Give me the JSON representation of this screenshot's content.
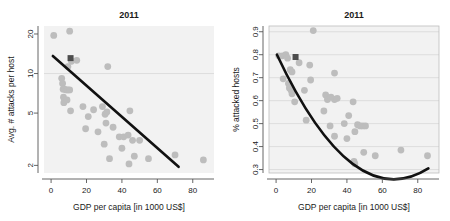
{
  "figure": {
    "width": 450,
    "height": 221,
    "background": "#ffffff",
    "point_color": "#bdbdbd",
    "highlight_color": "#4d4d4d",
    "trend_color": "#111111",
    "grid_color": "#d8d8d8",
    "panel_color": "#f2f2f2"
  },
  "chart_data": [
    {
      "type": "scatter",
      "id": "left",
      "title": "2011",
      "xlabel": "GDP per capita [in 1000 US$]",
      "ylabel": "Avg. # attacks per host",
      "xlim": [
        -4,
        92
      ],
      "ylim": [
        1.75,
        23
      ],
      "yscale": "log",
      "xscale": "linear",
      "xticks": [
        0,
        20,
        40,
        60,
        80
      ],
      "xticklabels": [
        "0",
        "20",
        "40",
        "60",
        "80"
      ],
      "yticks": [
        2,
        5,
        10,
        20
      ],
      "yticklabels": [
        "2",
        "5",
        "10",
        "20"
      ],
      "gridlines_y": [
        10
      ],
      "grid": "horizontal-sparse",
      "legend": "none",
      "points": [
        {
          "x": 1.5,
          "y": 19.5
        },
        {
          "x": 10.5,
          "y": 21.0
        },
        {
          "x": 9.5,
          "y": 11.3
        },
        {
          "x": 11.5,
          "y": 12.4
        },
        {
          "x": 14.5,
          "y": 12.6
        },
        {
          "x": 32.0,
          "y": 11.3
        },
        {
          "x": 6.0,
          "y": 9.2
        },
        {
          "x": 6.5,
          "y": 8.4
        },
        {
          "x": 6.8,
          "y": 7.6
        },
        {
          "x": 7.5,
          "y": 7.6
        },
        {
          "x": 8.5,
          "y": 7.5
        },
        {
          "x": 9.5,
          "y": 7.5
        },
        {
          "x": 10.5,
          "y": 7.5
        },
        {
          "x": 7.0,
          "y": 6.6
        },
        {
          "x": 7.2,
          "y": 6.0
        },
        {
          "x": 9.0,
          "y": 6.3
        },
        {
          "x": 11.0,
          "y": 5.2
        },
        {
          "x": 18.0,
          "y": 5.6
        },
        {
          "x": 21.0,
          "y": 4.7
        },
        {
          "x": 24.0,
          "y": 5.3
        },
        {
          "x": 29.0,
          "y": 5.6
        },
        {
          "x": 30.5,
          "y": 4.9
        },
        {
          "x": 31.5,
          "y": 5.1
        },
        {
          "x": 44.5,
          "y": 5.2
        },
        {
          "x": 19.5,
          "y": 3.8
        },
        {
          "x": 26.5,
          "y": 3.6
        },
        {
          "x": 31.0,
          "y": 4.2
        },
        {
          "x": 35.0,
          "y": 3.9
        },
        {
          "x": 38.5,
          "y": 3.3
        },
        {
          "x": 41.0,
          "y": 3.3
        },
        {
          "x": 43.5,
          "y": 3.4
        },
        {
          "x": 46.0,
          "y": 3.1
        },
        {
          "x": 50.0,
          "y": 3.1
        },
        {
          "x": 30.0,
          "y": 2.9
        },
        {
          "x": 40.0,
          "y": 2.7
        },
        {
          "x": 44.0,
          "y": 2.05
        },
        {
          "x": 33.0,
          "y": 2.25
        },
        {
          "x": 47.0,
          "y": 2.35
        },
        {
          "x": 55.0,
          "y": 2.25
        },
        {
          "x": 70.0,
          "y": 2.4
        },
        {
          "x": 86.0,
          "y": 2.2
        }
      ],
      "highlight_point": {
        "x": 11.0,
        "y": 13.1,
        "shape": "square"
      },
      "trend": {
        "type": "line",
        "x0": 1.0,
        "y0": 13.6,
        "x1": 72.0,
        "y1": 1.95
      }
    },
    {
      "type": "scatter",
      "id": "right",
      "title": "2011",
      "xlabel": "GDP per capita [in 1000 US$]",
      "ylabel": "% attacked hosts",
      "xlim": [
        -4,
        92
      ],
      "ylim": [
        0.285,
        0.925
      ],
      "yscale": "linear",
      "xscale": "linear",
      "xticks": [
        0,
        20,
        40,
        60,
        80
      ],
      "xticklabels": [
        "0",
        "20",
        "40",
        "60",
        "80"
      ],
      "yticks": [
        0.3,
        0.4,
        0.5,
        0.6,
        0.7,
        0.8,
        0.9
      ],
      "yticklabels": [
        "0.3",
        "0.4",
        "0.5",
        "0.6",
        "0.7",
        "0.8",
        "0.9"
      ],
      "gridlines_y": [
        0.3,
        0.4,
        0.5,
        0.6,
        0.7,
        0.8,
        0.9
      ],
      "grid": "horizontal",
      "legend": "none",
      "points": [
        {
          "x": 21.0,
          "y": 0.905
        },
        {
          "x": 1.5,
          "y": 0.795
        },
        {
          "x": 3.5,
          "y": 0.795
        },
        {
          "x": 5.5,
          "y": 0.8
        },
        {
          "x": 6.5,
          "y": 0.785
        },
        {
          "x": 13.0,
          "y": 0.765
        },
        {
          "x": 19.0,
          "y": 0.755
        },
        {
          "x": 4.0,
          "y": 0.695
        },
        {
          "x": 8.0,
          "y": 0.735
        },
        {
          "x": 9.0,
          "y": 0.725
        },
        {
          "x": 19.5,
          "y": 0.69
        },
        {
          "x": 33.0,
          "y": 0.72
        },
        {
          "x": 7.0,
          "y": 0.675
        },
        {
          "x": 7.5,
          "y": 0.655
        },
        {
          "x": 8.5,
          "y": 0.645
        },
        {
          "x": 9.0,
          "y": 0.63
        },
        {
          "x": 16.0,
          "y": 0.645
        },
        {
          "x": 28.0,
          "y": 0.625
        },
        {
          "x": 29.0,
          "y": 0.605
        },
        {
          "x": 31.0,
          "y": 0.615
        },
        {
          "x": 33.0,
          "y": 0.605
        },
        {
          "x": 34.5,
          "y": 0.61
        },
        {
          "x": 10.5,
          "y": 0.595
        },
        {
          "x": 43.5,
          "y": 0.595
        },
        {
          "x": 27.0,
          "y": 0.555
        },
        {
          "x": 41.0,
          "y": 0.535
        },
        {
          "x": 17.0,
          "y": 0.515
        },
        {
          "x": 38.5,
          "y": 0.5
        },
        {
          "x": 46.0,
          "y": 0.495
        },
        {
          "x": 47.5,
          "y": 0.49
        },
        {
          "x": 49.0,
          "y": 0.49
        },
        {
          "x": 50.5,
          "y": 0.49
        },
        {
          "x": 30.5,
          "y": 0.49
        },
        {
          "x": 44.5,
          "y": 0.465
        },
        {
          "x": 33.0,
          "y": 0.445
        },
        {
          "x": 40.0,
          "y": 0.435
        },
        {
          "x": 49.5,
          "y": 0.375
        },
        {
          "x": 56.0,
          "y": 0.36
        },
        {
          "x": 70.5,
          "y": 0.385
        },
        {
          "x": 85.5,
          "y": 0.36
        },
        {
          "x": 44.0,
          "y": 0.335
        },
        {
          "x": 44.5,
          "y": 0.325
        }
      ],
      "highlight_point": {
        "x": 11.0,
        "y": 0.79,
        "shape": "square"
      },
      "trend": {
        "type": "curve",
        "x0": 0.5,
        "y0": 0.8,
        "x1": 86.0,
        "y1": 0.305,
        "curvature": 0.42
      }
    }
  ]
}
